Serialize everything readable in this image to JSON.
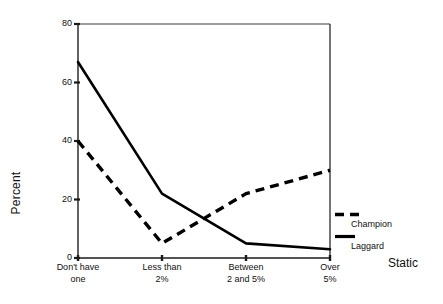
{
  "chart_data": {
    "type": "line",
    "title": "",
    "subtitle": "",
    "xlabel": "Static",
    "ylabel": "Percent",
    "categories": [
      "Don't have one",
      "Less than 2%",
      "Between 2 and 5%",
      "Over 5%"
    ],
    "category_lines": [
      [
        "Don't have",
        "one"
      ],
      [
        "Less than",
        "2%"
      ],
      [
        "Between",
        "2 and 5%"
      ],
      [
        "Over",
        "5%"
      ]
    ],
    "series": [
      {
        "name": "Laggard",
        "style": "solid",
        "color": "#000000",
        "values": [
          67,
          22,
          5,
          3
        ]
      },
      {
        "name": "Champion",
        "style": "dashed",
        "color": "#000000",
        "values": [
          40,
          5,
          22,
          30
        ]
      }
    ],
    "ylim": [
      0,
      80
    ],
    "yticks": [
      0,
      20,
      40,
      60,
      80
    ],
    "ytick_labels": [
      "0",
      "20",
      "40",
      "60",
      "80"
    ],
    "grid": false,
    "legend_position": "right-inside-outside",
    "legend_entries": [
      "Champion",
      "Laggard"
    ],
    "axis_color": "#000000",
    "background_color": "#ffffff"
  },
  "axes": {
    "y_title": "Percent",
    "x_title": "Static"
  },
  "legend": {
    "items": [
      {
        "label": "Champion",
        "swatch": "dashed-line-swatch"
      },
      {
        "label": "Laggard",
        "swatch": "solid-line-swatch"
      }
    ]
  }
}
